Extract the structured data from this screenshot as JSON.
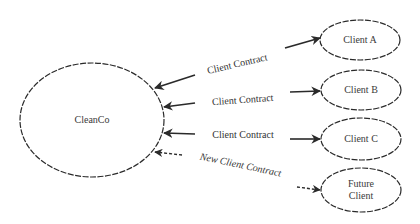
{
  "diagram": {
    "colors": {
      "stroke": "#2a2a2a",
      "text": "#333333",
      "background": "#ffffff"
    },
    "center_node": {
      "label": "CleanCo"
    },
    "client_nodes": [
      {
        "label_lines": [
          "Client A"
        ],
        "style": "solid"
      },
      {
        "label_lines": [
          "Client B"
        ],
        "style": "solid"
      },
      {
        "label_lines": [
          "Client C"
        ],
        "style": "solid"
      },
      {
        "label_lines": [
          "Future",
          "Client"
        ],
        "style": "solid"
      }
    ],
    "edges": [
      {
        "label": "Client Contract",
        "style": "solid",
        "direction": "bidirectional"
      },
      {
        "label": "Client Contract",
        "style": "solid",
        "direction": "bidirectional"
      },
      {
        "label": "Client Contract",
        "style": "solid",
        "direction": "bidirectional"
      },
      {
        "label": "New Client Contract",
        "style": "dashed",
        "direction": "bidirectional"
      }
    ]
  }
}
